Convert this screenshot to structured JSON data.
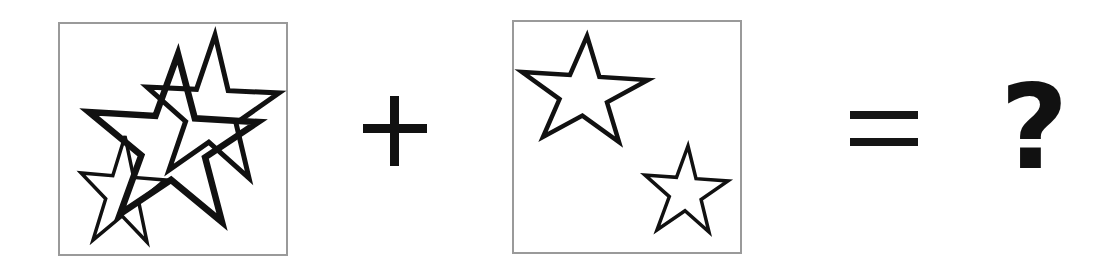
{
  "puzzle": {
    "operator_plus": "+",
    "operator_equals": "=",
    "answer_placeholder": "?",
    "colors": {
      "stroke": "#111111",
      "panel_border": "#9a9a9a",
      "background": "#ffffff"
    },
    "panels": [
      {
        "name": "left-panel",
        "description": "Three overlapping star outlines",
        "star_count": 3
      },
      {
        "name": "right-panel",
        "description": "Two separate star outlines",
        "star_count": 2
      }
    ]
  }
}
